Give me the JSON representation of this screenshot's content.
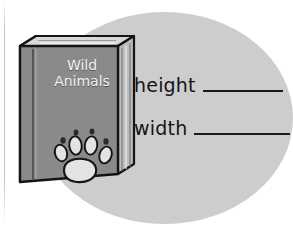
{
  "worksheet": {
    "backdrop": {
      "shape": "ellipse",
      "color": "#cdcdcd"
    },
    "book": {
      "name": "wild-animals-book",
      "title_line1": "Wild",
      "title_line2": "Animals",
      "cover_color": "#8a8a8a",
      "outline_color": "#141414",
      "pages_color": "#e8e8e8",
      "title_color": "#f2f2f2",
      "cover_art": {
        "name": "paw-print",
        "pad_color": "#e3e3e3",
        "toe_count": 4,
        "claw_count": 4
      }
    },
    "measurements": [
      {
        "label": "height",
        "value": "",
        "blank": true
      },
      {
        "label": "width",
        "value": "",
        "blank": true
      }
    ]
  }
}
